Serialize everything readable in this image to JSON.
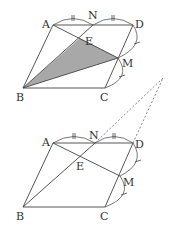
{
  "figures": [
    {
      "id": "upper",
      "labels": {
        "A": "A",
        "N": "N",
        "D": "D",
        "E": "E",
        "M": "M",
        "B": "B",
        "C": "C"
      },
      "shaded_region": "triangle BEM",
      "shade_color": "#a8a8a8"
    },
    {
      "id": "lower",
      "labels": {
        "A": "A",
        "N": "N",
        "D": "D",
        "E": "E",
        "M": "M",
        "B": "B",
        "C": "C"
      }
    }
  ],
  "notes": {
    "equal_marks": "AN = ND (double tick), DM = MC (single tick)",
    "dashed_extensions": "lines BN and CD extended meet outside the figure"
  }
}
